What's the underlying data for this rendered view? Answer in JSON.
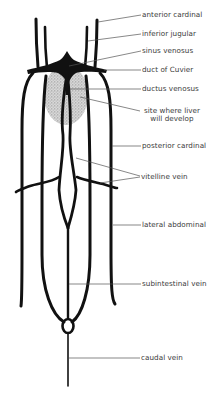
{
  "diagram": {
    "colors": {
      "vessel": "#111111",
      "liver_stipple": "#c8c8c8",
      "leader_line": "#555555",
      "label_text": "#3a3a3a",
      "background": "#ffffff"
    },
    "labels": [
      {
        "id": "anterior-cardinal",
        "text": "anterior cardinal"
      },
      {
        "id": "inferior-jugular",
        "text": "inferior jugular"
      },
      {
        "id": "sinus-venosus",
        "text": "sinus venosus"
      },
      {
        "id": "duct-of-cuvier",
        "text": "duct of Cuvier"
      },
      {
        "id": "ductus-venosus",
        "text": "ductus venosus"
      },
      {
        "id": "liver-site",
        "line1": "site where liver",
        "line2": "will develop"
      },
      {
        "id": "posterior-cardinal",
        "text": "posterior cardinal"
      },
      {
        "id": "vitelline-vein",
        "text": "vitelline vein"
      },
      {
        "id": "lateral-abdominal",
        "text": "lateral abdominal"
      },
      {
        "id": "subintestinal-vein",
        "text": "subintestinal vein"
      },
      {
        "id": "caudal-vein",
        "text": "caudal vein"
      }
    ]
  }
}
